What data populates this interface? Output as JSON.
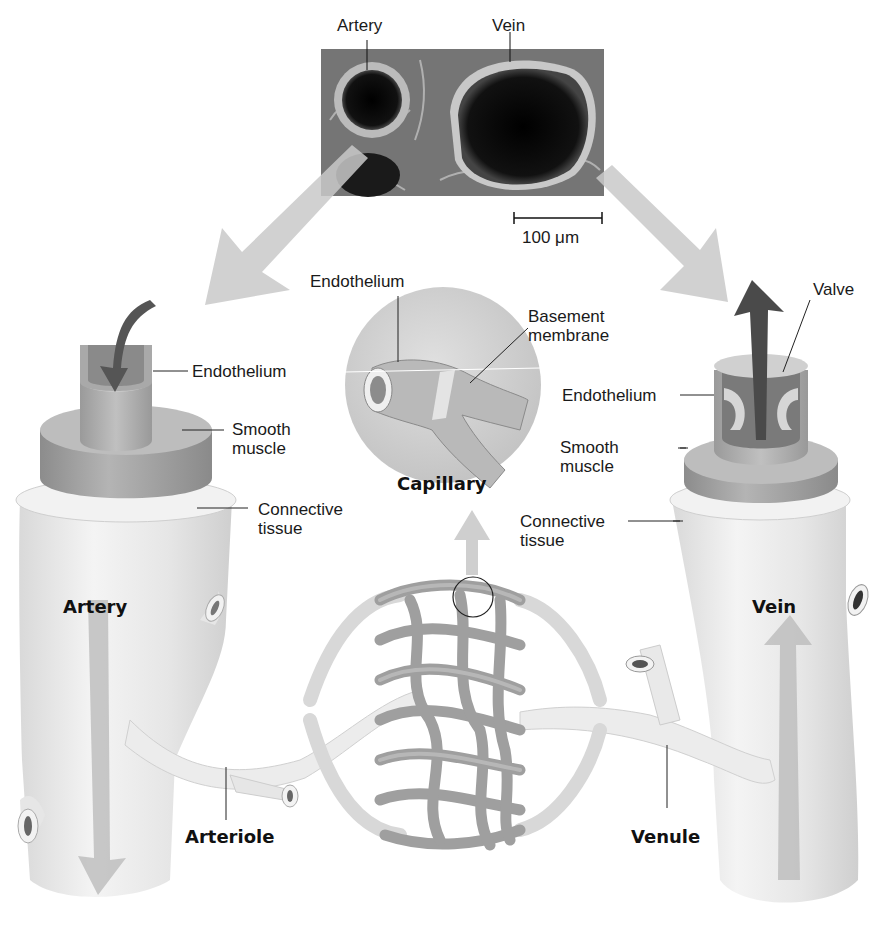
{
  "micrograph": {
    "labels": {
      "artery": "Artery",
      "vein": "Vein"
    },
    "scale_bar": "100 μm"
  },
  "artery_cutaway": {
    "layers": {
      "endothelium": "Endothelium",
      "smooth_muscle_line1": "Smooth",
      "smooth_muscle_line2": "muscle",
      "connective_tissue_line1": "Connective",
      "connective_tissue_line2": "tissue"
    },
    "title": "Artery"
  },
  "capillary_inset": {
    "endothelium": "Endothelium",
    "basement_membrane_line1": "Basement",
    "basement_membrane_line2": "membrane",
    "title": "Capillary"
  },
  "vein_cutaway": {
    "layers": {
      "valve": "Valve",
      "endothelium": "Endothelium",
      "smooth_muscle_line1": "Smooth",
      "smooth_muscle_line2": "muscle",
      "connective_tissue_line1": "Connective",
      "connective_tissue_line2": "tissue"
    },
    "title": "Vein"
  },
  "lower_vessels": {
    "arteriole": "Arteriole",
    "venule": "Venule"
  },
  "colors": {
    "vessel_light": "#ececec",
    "vessel_mid": "#c8c8c8",
    "vessel_dark": "#9a9a9a",
    "arrow_gray": "#bdbdbd",
    "flow_arrow": "#5a5a5a"
  }
}
